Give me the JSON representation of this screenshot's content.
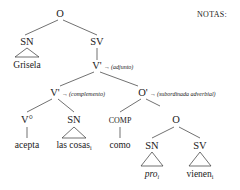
{
  "notes": {
    "label": "NOTAS:"
  },
  "tree": {
    "root": {
      "label": "O"
    },
    "subject": {
      "label": "SN",
      "word": "Grisela"
    },
    "vp": {
      "label": "SV"
    },
    "vbar_top": {
      "label": "V'",
      "annotation": "(adjunto)"
    },
    "vbar_inner": {
      "label": "V'",
      "annotation": "(complemento)"
    },
    "obar": {
      "label": "O'",
      "annotation": "(subordinada adverbial)"
    },
    "verb": {
      "label": "V°",
      "word": "acepta"
    },
    "object": {
      "label": "SN",
      "word": "las cosas",
      "index": "i"
    },
    "comp": {
      "label": "COMP",
      "word": "como"
    },
    "embedded_clause": {
      "label": "O"
    },
    "embedded_subject": {
      "label": "SN",
      "word": "pro",
      "index": "i"
    },
    "embedded_vp": {
      "label": "SV",
      "word": "vienen",
      "index": "i"
    }
  },
  "arrow_glyph": "→",
  "colors": {
    "ink": "#1a1a1a",
    "background": "#ffffff"
  }
}
